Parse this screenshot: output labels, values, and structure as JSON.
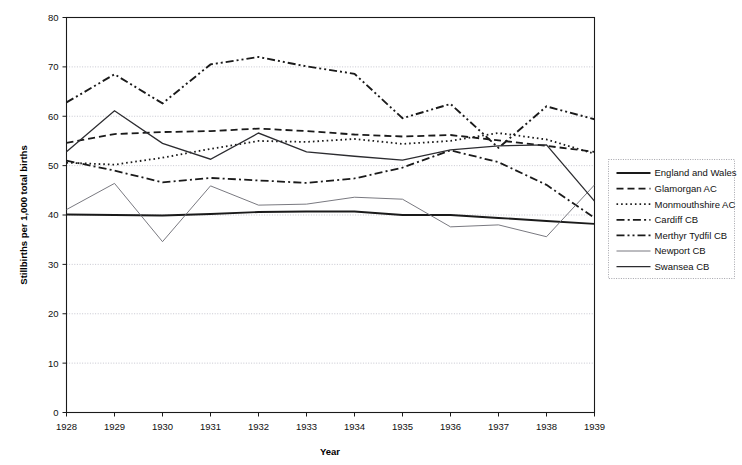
{
  "chart_data": {
    "type": "line",
    "title": "",
    "xlabel": "Year",
    "ylabel": "Stillbirths per 1,000 total births",
    "grid": true,
    "legend_position": "right",
    "xlim": [
      1928,
      1939
    ],
    "ylim": [
      0,
      80
    ],
    "yticks": [
      0,
      10,
      20,
      30,
      40,
      50,
      60,
      70,
      80
    ],
    "ytick_labels": [
      "0",
      "10",
      "20",
      "30",
      "40",
      "50",
      "60",
      "70",
      "80"
    ],
    "x": [
      1928,
      1929,
      1930,
      1931,
      1932,
      1933,
      1934,
      1935,
      1936,
      1937,
      1938,
      1939
    ],
    "xtick_labels": [
      "1928",
      "1929",
      "1930",
      "1931",
      "1932",
      "1933",
      "1934",
      "1935",
      "1936",
      "1937",
      "1938",
      "1939"
    ],
    "series": [
      {
        "name": "England and Wales",
        "style": "solid",
        "width": 1.9,
        "color": "#1a1a1a",
        "values": [
          40.1,
          40.0,
          39.9,
          40.2,
          40.6,
          40.7,
          40.7,
          40.0,
          40.0,
          39.4,
          38.8,
          38.2
        ]
      },
      {
        "name": "Glamorgan AC",
        "style": "dashed",
        "width": 1.8,
        "color": "#1a1a1a",
        "values": [
          54.6,
          56.4,
          56.8,
          57.0,
          57.5,
          57.0,
          56.3,
          55.9,
          56.2,
          55.1,
          54.0,
          52.8
        ]
      },
      {
        "name": "Monmouthshire AC",
        "style": "dotted",
        "width": 1.8,
        "color": "#1a1a1a",
        "values": [
          50.6,
          50.2,
          51.6,
          53.4,
          55.0,
          54.8,
          55.4,
          54.4,
          55.0,
          56.6,
          55.3,
          52.4
        ]
      },
      {
        "name": "Cardiff CB",
        "style": "dashdot",
        "width": 1.8,
        "color": "#1a1a1a",
        "values": [
          51.0,
          49.0,
          46.6,
          47.5,
          47.0,
          46.5,
          47.4,
          49.6,
          53.1,
          50.7,
          46.1,
          39.4
        ]
      },
      {
        "name": "Merthyr Tydfil CB",
        "style": "dashdotdot",
        "width": 1.9,
        "color": "#1a1a1a",
        "values": [
          62.8,
          68.5,
          62.6,
          70.5,
          72.0,
          70.1,
          68.6,
          59.6,
          62.5,
          53.6,
          62.0,
          59.4
        ]
      },
      {
        "name": "Newport CB",
        "style": "solid",
        "width": 0.9,
        "color": "#6a6a72",
        "values": [
          41.1,
          46.4,
          34.6,
          45.9,
          42.0,
          42.2,
          43.6,
          43.2,
          37.6,
          38.0,
          35.6,
          46.1
        ]
      },
      {
        "name": "Swansea CB",
        "style": "solid",
        "width": 1.3,
        "color": "#2c2c30",
        "values": [
          52.8,
          61.1,
          54.5,
          51.3,
          56.6,
          52.8,
          51.9,
          51.1,
          53.2,
          54.0,
          54.2,
          42.8
        ]
      }
    ]
  }
}
